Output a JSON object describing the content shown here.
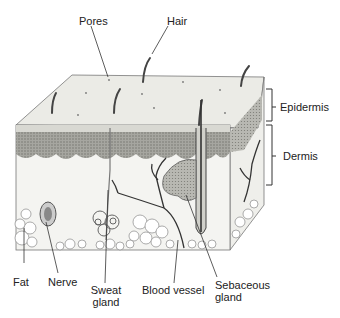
{
  "labels": {
    "pores": "Pores",
    "hair": "Hair",
    "epidermis": "Epidermis",
    "dermis": "Dermis",
    "fat": "Fat",
    "nerve": "Nerve",
    "sweat_gland_1": "Sweat",
    "sweat_gland_2": "gland",
    "blood_vessel": "Blood vessel",
    "sebaceous_gland_1": "Sebaceous",
    "sebaceous_gland_2": "gland"
  },
  "colors": {
    "surface": "#ebebe6",
    "epidermis_layer": "#9a9a94",
    "dermis": "#f4f4f1",
    "outline": "#555555",
    "text": "#222222"
  }
}
